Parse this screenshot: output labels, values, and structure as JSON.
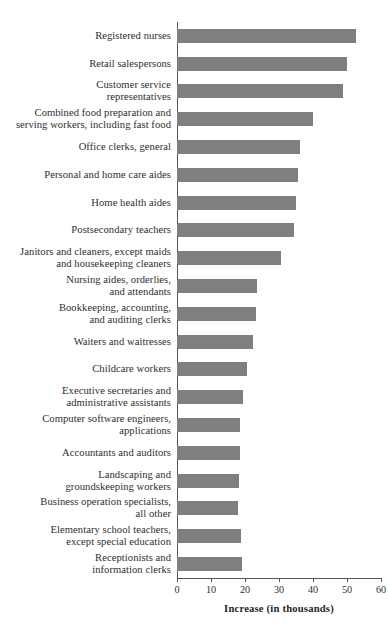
{
  "chart_data": {
    "type": "bar",
    "orientation": "horizontal",
    "title": "",
    "xlabel": "Increase (in thousands)",
    "ylabel": "",
    "xlim": [
      0,
      60
    ],
    "xticks": [
      0,
      10,
      20,
      30,
      40,
      50,
      60
    ],
    "grid": false,
    "legend": null,
    "bar_color": "#7f7f7f",
    "categories": [
      "Registered nurses",
      "Retail salespersons",
      "Customer service\nrepresentatives",
      "Combined food preparation and\nserving workers, including fast food",
      "Office clerks, general",
      "Personal and home care aides",
      "Home health aides",
      "Postsecondary teachers",
      "Janitors and cleaners, except maids\nand housekeeping cleaners",
      "Nursing aides, orderlies,\nand attendants",
      "Bookkeeping, accounting,\nand auditing clerks",
      "Waiters and waitresses",
      "Childcare workers",
      "Executive secretaries and\nadministrative assistants",
      "Computer software engineers,\napplications",
      "Accountants and auditors",
      "Landscaping and\ngroundskeeping workers",
      "Business operation specialists,\nall other",
      "Elementary school teachers,\nexcept special education",
      "Receptionists and\ninformation clerks"
    ],
    "values": [
      52.6,
      50.0,
      48.8,
      40.0,
      36.2,
      35.6,
      35.0,
      34.4,
      30.6,
      23.5,
      23.2,
      22.4,
      20.6,
      19.4,
      18.5,
      18.5,
      18.2,
      17.9,
      18.8,
      19.1
    ]
  }
}
